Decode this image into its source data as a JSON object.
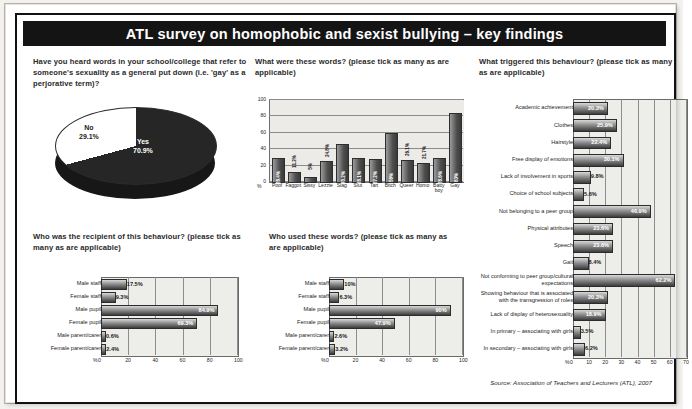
{
  "title": "ATL survey on homophobic and sexist bullying – key findings",
  "source": "Source: Association of Teachers and Lecturers (ATL), 2007",
  "questions": {
    "q1": "Have you heard words in your school/college that refer to someone's sexuality as a general put down (i.e. 'gay' as a perjorative term)?",
    "q2": "What were these words? (please tick as many as are applicable)",
    "q3": "What triggered this behaviour? (please tick as many as are applicable)",
    "q4": "Who was the recipient of this behaviour? (please tick as many as are applicable)",
    "q5": "Who used these words? (please tick as many as are applicable)"
  },
  "chart_data": [
    {
      "id": "heard-words-pie",
      "type": "pie",
      "title": "Have you heard words in your school/college that refer to someone's sexuality as a general put down (i.e. 'gay' as a perjorative term)?",
      "categories": [
        "Yes",
        "No"
      ],
      "values": [
        70.9,
        29.1
      ],
      "labels": [
        "70.9%",
        "29.1%"
      ],
      "units": "percent",
      "legend": "none"
    },
    {
      "id": "which-words-bar",
      "type": "bar",
      "title": "What were these words? (please tick as many as are applicable)",
      "orientation": "vertical",
      "categories": [
        "Poof",
        "Faggot",
        "Sissy",
        "Lezzie",
        "Slag",
        "Slut",
        "Tart",
        "Bitch",
        "Queer",
        "Homo",
        "Batty boy",
        "Gay"
      ],
      "values": [
        28.4,
        11.2,
        5.0,
        24.8,
        45.2,
        28.1,
        27.2,
        58.0,
        26.1,
        21.7,
        28.6,
        83.0
      ],
      "labels": [
        "28.4%",
        "11.2%",
        "5%",
        "24.8%",
        "45.2%",
        "28.1%",
        "27.2%",
        "58%",
        "26.1%",
        "21.7%",
        "28.6%",
        "83%"
      ],
      "ylabel": "%",
      "ylim": [
        0,
        100
      ],
      "yticks": [
        0,
        20,
        40,
        60,
        80,
        100
      ],
      "grid": true
    },
    {
      "id": "triggers-bar",
      "type": "bar",
      "title": "What triggered this behaviour? (please tick as many as are applicable)",
      "orientation": "horizontal",
      "categories": [
        "Academic achievement",
        "Clothes",
        "Hairstyle",
        "Free display of emotions",
        "Lack of involvement in sports",
        "Choice of school subjects",
        "Not belonging to a peer group",
        "Physical attributes",
        "Speech",
        "Gait",
        "Not conforming to peer group/cultural expectations",
        "Showing behaviour that is associated with the transgression of roles",
        "Lack of display of heterosexuality",
        "In primary – associating with girls",
        "In secondary – associating with girls"
      ],
      "values": [
        20.3,
        25.9,
        22.4,
        30.1,
        9.8,
        5.6,
        46.9,
        23.6,
        23.6,
        8.4,
        62.2,
        20.3,
        18.9,
        3.5,
        6.2
      ],
      "labels": [
        "20.3%",
        "25.9%",
        "22.4%",
        "30.1%",
        "9.8%",
        "5.6%",
        "46.9%",
        "23.6%",
        "23.6%",
        "8.4%",
        "62.2%",
        "20.3%",
        "18.9%",
        "3.5%",
        "6.2%"
      ],
      "xlabel": "%",
      "xlim": [
        0,
        70
      ],
      "xticks": [
        0,
        10,
        20,
        30,
        40,
        50,
        60,
        70
      ],
      "grid": true
    },
    {
      "id": "recipient-bar",
      "type": "bar",
      "title": "Who was the recipient of this behaviour? (please tick as many as are applicable)",
      "orientation": "horizontal",
      "categories": [
        "Male staff",
        "Female staff",
        "Male pupil",
        "Female pupil",
        "Male parent/carer",
        "Female parent/carer"
      ],
      "values": [
        17.5,
        9.3,
        84.9,
        69.3,
        0.6,
        2.4
      ],
      "labels": [
        "17.5%",
        "9.3%",
        "84.9%",
        "69.3%",
        "0.6%",
        "2.4%"
      ],
      "xlabel": "%",
      "xlim": [
        0,
        100
      ],
      "xticks": [
        0,
        20,
        40,
        60,
        80,
        100
      ],
      "grid": true
    },
    {
      "id": "who-used-bar",
      "type": "bar",
      "title": "Who used these words? (please tick as many as are applicable)",
      "orientation": "horizontal",
      "categories": [
        "Male staff",
        "Female staff",
        "Male pupil",
        "Female pupil",
        "Male parent/carer",
        "Female parent/carer"
      ],
      "values": [
        10.0,
        6.3,
        90.0,
        47.9,
        2.6,
        3.2
      ],
      "labels": [
        "10%",
        "6.3%",
        "90%",
        "47.9%",
        "2.6%",
        "3.2%"
      ],
      "xlabel": "%",
      "xlim": [
        0,
        100
      ],
      "xticks": [
        0,
        20,
        40,
        60,
        80,
        100
      ],
      "grid": true
    }
  ]
}
